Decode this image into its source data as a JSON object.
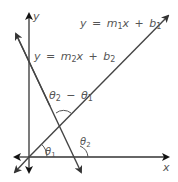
{
  "diagram": {
    "axes": {
      "x_label": "x",
      "y_label": "y"
    },
    "lines": [
      {
        "id": "line-1",
        "equation": {
          "y": "y",
          "eq": "=",
          "m": "m",
          "m_sub": "1",
          "x": "x",
          "plus": "+",
          "b": "b",
          "b_sub": "1"
        },
        "text": "y = m1x + b1"
      },
      {
        "id": "line-2",
        "equation": {
          "y": "y",
          "eq": "=",
          "m": "m",
          "m_sub": "2",
          "x": "x",
          "plus": "+",
          "b": "b",
          "b_sub": "2"
        },
        "text": "y = m2x + b2"
      }
    ],
    "angles": {
      "theta1": {
        "sym": "θ",
        "sub": "1"
      },
      "theta2": {
        "sym": "θ",
        "sub": "2"
      },
      "difference": {
        "a": "θ",
        "a_sub": "2",
        "minus": "−",
        "b": "θ",
        "b_sub": "1"
      }
    },
    "colors": {
      "axis": "#222222",
      "line": "#444444",
      "text": "#555555"
    }
  }
}
